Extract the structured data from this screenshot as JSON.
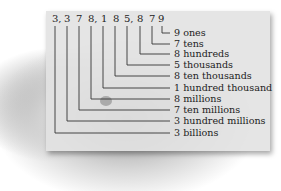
{
  "number": {
    "digits": [
      "3,",
      "3",
      "7",
      "8,",
      "1",
      "8",
      "5,",
      "8",
      "7",
      "9"
    ],
    "full": "3, 3 7 8, 1 8 5, 8 7 9"
  },
  "place_values": [
    {
      "label": "9 ones"
    },
    {
      "label": "7 tens"
    },
    {
      "label": "8 hundreds"
    },
    {
      "label": "5 thousands"
    },
    {
      "label": "8 ten thousands"
    },
    {
      "label": "1 hundred thousand"
    },
    {
      "label": "8 millions"
    },
    {
      "label": "7 ten millions"
    },
    {
      "label": "3 hundred millions"
    },
    {
      "label": "3 billions"
    }
  ],
  "colors": {
    "panel": "#e2e2e2",
    "ink": "#222222"
  }
}
